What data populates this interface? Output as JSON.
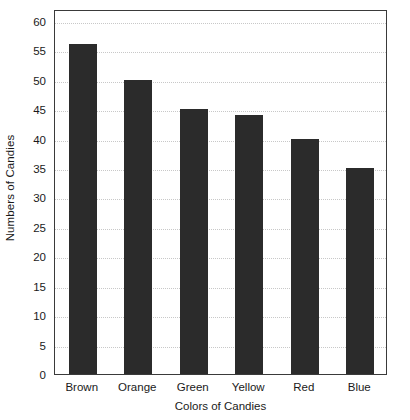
{
  "chart_data": {
    "type": "bar",
    "title": "",
    "xlabel": "Colors of Candies",
    "ylabel": "Numbers of Candies",
    "categories": [
      "Brown",
      "Orange",
      "Green",
      "Yellow",
      "Red",
      "Blue"
    ],
    "values": [
      56,
      50,
      45,
      44,
      40,
      35
    ],
    "ylim": [
      0,
      62
    ],
    "yticks": [
      0,
      5,
      10,
      15,
      20,
      25,
      30,
      35,
      40,
      45,
      50,
      55,
      60
    ],
    "ytick_labels": [
      "0",
      "5",
      "10",
      "15",
      "20",
      "25",
      "30",
      "35",
      "40",
      "45",
      "50",
      "55",
      "60"
    ],
    "grid": true,
    "grid_axis": "y",
    "grid_style": "dotted",
    "legend": false,
    "legend_position": "none",
    "bar_color": "#2b2b2b",
    "grid_color": "#c8c8c8",
    "frame_color": "#3a3a3a",
    "background_color": "#ffffff"
  }
}
